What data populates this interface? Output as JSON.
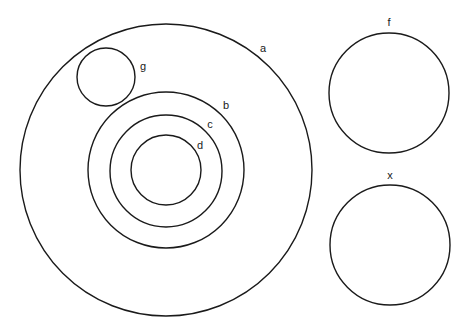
{
  "diagram": {
    "type": "set-diagram",
    "circles": [
      {
        "id": "a",
        "label": "a",
        "cx": 166,
        "cy": 170,
        "r": 146,
        "lx": 263,
        "ly": 52
      },
      {
        "id": "g",
        "label": "g",
        "cx": 106,
        "cy": 77,
        "r": 29,
        "lx": 143,
        "ly": 70
      },
      {
        "id": "b",
        "label": "b",
        "cx": 166,
        "cy": 170,
        "r": 78,
        "lx": 226,
        "ly": 109
      },
      {
        "id": "c",
        "label": "c",
        "cx": 166,
        "cy": 171,
        "r": 56,
        "lx": 210,
        "ly": 128
      },
      {
        "id": "d",
        "label": "d",
        "cx": 166,
        "cy": 170,
        "r": 35,
        "lx": 200,
        "ly": 149
      },
      {
        "id": "f",
        "label": "f",
        "cx": 389,
        "cy": 93,
        "r": 60,
        "lx": 389,
        "ly": 26
      },
      {
        "id": "x",
        "label": "x",
        "cx": 390,
        "cy": 245,
        "r": 60,
        "lx": 390,
        "ly": 179
      }
    ],
    "relations": {
      "a_contains": [
        "g",
        "b"
      ],
      "b_contains": [
        "c"
      ],
      "c_contains": [
        "d"
      ],
      "disjoint_from_a": [
        "f",
        "x"
      ]
    }
  }
}
